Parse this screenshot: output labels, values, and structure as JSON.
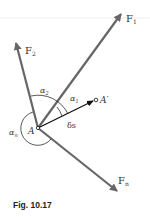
{
  "figure": {
    "caption": "Fig. 10.17",
    "labels": {
      "f1": "F",
      "f1_sub": "1",
      "f2": "F",
      "f2_sub": "2",
      "fn": "F",
      "fn_sub": "n",
      "point_a": "A",
      "point_a_prime": "A′",
      "displacement": "δs",
      "alpha1": "α",
      "alpha1_sub": "1",
      "alpha2": "α",
      "alpha2_sub": "2",
      "alphan": "α",
      "alphan_sub": "n"
    },
    "colors": {
      "force_vector": "#666666",
      "displacement_vector": "#111111",
      "text": "#333333"
    }
  }
}
